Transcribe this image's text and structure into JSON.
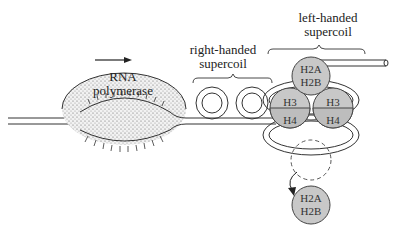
{
  "diagram": {
    "type": "transcription-supercoiling",
    "rna_polymerase": {
      "label_line1": "RNA",
      "label_line2": "polymerase",
      "direction": "right"
    },
    "right_supercoil": {
      "label_line1": "right-handed",
      "label_line2": "supercoil",
      "loops": 2
    },
    "left_supercoil": {
      "label_line1": "left-handed",
      "label_line2": "supercoil"
    },
    "histones": {
      "top": {
        "line1": "H2A",
        "line2": "H2B"
      },
      "h3_left": "H3",
      "h3_right": "H3",
      "h4_left": "H4",
      "h4_right": "H4",
      "displaced": {
        "line1": "H2A",
        "line2": "H2B"
      }
    },
    "colors": {
      "line": "#333333",
      "histone_fill": "#c8c8c8",
      "polymerase_dots": "#555555"
    }
  }
}
